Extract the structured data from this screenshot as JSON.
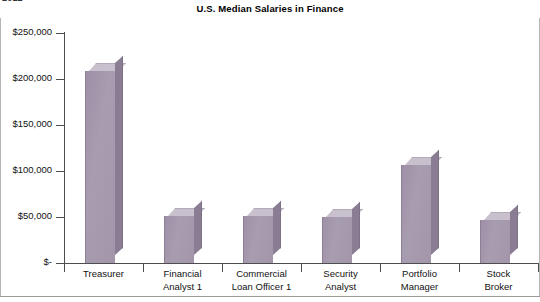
{
  "top_clipped_text": "2012",
  "chart_data": {
    "type": "bar",
    "title": "U.S. Median Salaries in Finance",
    "subtitle": "",
    "xlabel": "",
    "ylabel": "",
    "categories": [
      "Treasurer",
      "Financial Analyst 1",
      "Commercial Loan Officer 1",
      "Security Analyst",
      "Portfolio Manager",
      "Stock Broker"
    ],
    "category_lines": [
      [
        "Treasurer"
      ],
      [
        "Financial",
        "Analyst 1"
      ],
      [
        "Commercial",
        "Loan Officer 1"
      ],
      [
        "Security",
        "Analyst"
      ],
      [
        "Portfolio",
        "Manager"
      ],
      [
        "Stock",
        "Broker"
      ]
    ],
    "values": [
      209000,
      51000,
      51000,
      50000,
      107000,
      47000
    ],
    "ylim": [
      0,
      250000
    ],
    "ytick_values": [
      250000,
      200000,
      150000,
      100000,
      50000,
      0
    ],
    "ytick_labels": [
      "$250,000",
      "$200,000",
      "$150,000",
      "$100,000",
      "$50,000",
      "$-"
    ],
    "grid": false,
    "legend": "none",
    "style": "3d-column",
    "bar_color_front": "#a396ab",
    "bar_color_top": "#c8c0cd",
    "bar_color_side": "#8a7d93",
    "axis_color": "#4d4d4d",
    "background": "#ffffff"
  }
}
